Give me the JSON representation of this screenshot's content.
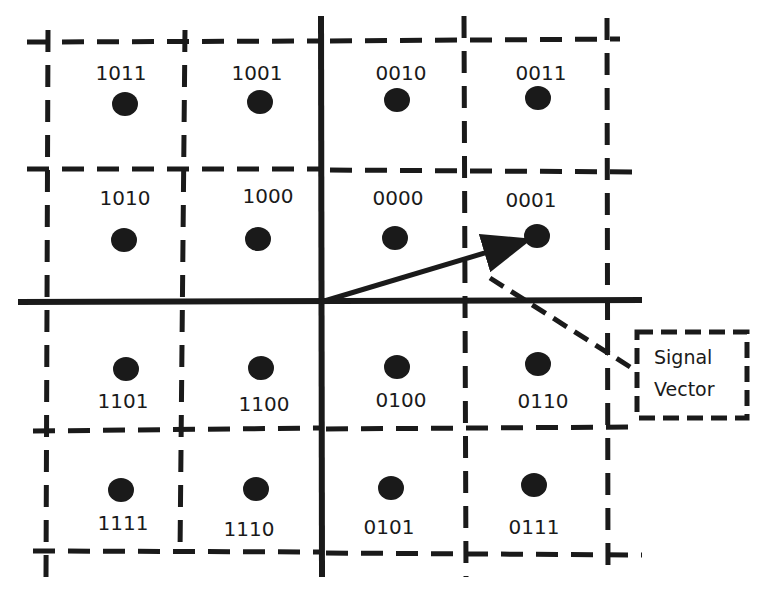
{
  "diagram": {
    "type": "16-QAM constellation",
    "colors": {
      "ink": "#1a1a1a",
      "background": "#ffffff"
    },
    "points": [
      {
        "label": "1011",
        "x": 125,
        "y": 104,
        "lx": 121,
        "ly": 80
      },
      {
        "label": "1001",
        "x": 260,
        "y": 102,
        "lx": 257,
        "ly": 80
      },
      {
        "label": "0010",
        "x": 397,
        "y": 100,
        "lx": 401,
        "ly": 80
      },
      {
        "label": "0011",
        "x": 538,
        "y": 98,
        "lx": 541,
        "ly": 80
      },
      {
        "label": "1010",
        "x": 124,
        "y": 240,
        "lx": 125,
        "ly": 205
      },
      {
        "label": "1000",
        "x": 258,
        "y": 239,
        "lx": 268,
        "ly": 203
      },
      {
        "label": "0000",
        "x": 395,
        "y": 238,
        "lx": 398,
        "ly": 205
      },
      {
        "label": "0001",
        "x": 537,
        "y": 236,
        "lx": 531,
        "ly": 207
      },
      {
        "label": "1101",
        "x": 126,
        "y": 369,
        "lx": 123,
        "ly": 408
      },
      {
        "label": "1100",
        "x": 261,
        "y": 368,
        "lx": 264,
        "ly": 411
      },
      {
        "label": "0100",
        "x": 397,
        "y": 367,
        "lx": 401,
        "ly": 407
      },
      {
        "label": "0110",
        "x": 538,
        "y": 364,
        "lx": 543,
        "ly": 408
      },
      {
        "label": "1111",
        "x": 121,
        "y": 490,
        "lx": 123,
        "ly": 530
      },
      {
        "label": "1110",
        "x": 256,
        "y": 489,
        "lx": 249,
        "ly": 536
      },
      {
        "label": "0101",
        "x": 391,
        "y": 488,
        "lx": 389,
        "ly": 534
      },
      {
        "label": "0111",
        "x": 534,
        "y": 485,
        "lx": 534,
        "ly": 534
      }
    ],
    "axes": {
      "horizontal": {
        "x1": 18,
        "y1": 302,
        "x2": 642,
        "y2": 300
      },
      "vertical": {
        "x1": 321,
        "y1": 16,
        "x2": 322,
        "y2": 577
      }
    },
    "signal_vector": {
      "from": [
        321,
        302
      ],
      "to": [
        528,
        240
      ]
    },
    "callout": {
      "line1": "Signal",
      "line2": "Vector",
      "box": {
        "x": 637,
        "y": 332,
        "w": 110,
        "h": 86
      }
    }
  }
}
